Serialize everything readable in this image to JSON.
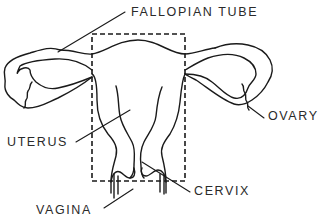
{
  "diagram": {
    "labels": {
      "fallopian_tube": "FALLOPIAN TUBE",
      "ovary": "OVARY",
      "uterus": "UTERUS",
      "cervix": "CERVIX",
      "vagina": "VAGINA"
    },
    "colors": {
      "line": "#1a1a1a",
      "text": "#2a2a2a",
      "background": "#ffffff"
    }
  }
}
